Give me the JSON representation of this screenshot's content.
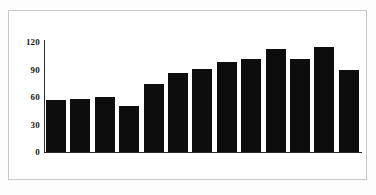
{
  "chart_data": {
    "type": "bar",
    "title": "",
    "subtitle": "",
    "xlabel": "",
    "ylabel": "",
    "categories": [
      "2006",
      "2007",
      "2008",
      "2009",
      "2010",
      "2011",
      "2012",
      "2013",
      "2014",
      "2015",
      "2016",
      "2017",
      "2018"
    ],
    "values": [
      57,
      58,
      60,
      50,
      74,
      86,
      91,
      98,
      102,
      112,
      102,
      115,
      90
    ],
    "data_labels": [
      "57",
      "58",
      "60",
      "50",
      "74",
      "86",
      "91",
      "98",
      "102",
      "112",
      "102",
      "115",
      "90"
    ],
    "ylim": [
      0,
      120
    ],
    "y_ticks": [
      0,
      30,
      60,
      90,
      120
    ],
    "y_tick_labels": [
      "0",
      "30",
      "60",
      "90",
      "120"
    ],
    "grid": false,
    "legend": null,
    "legend_position": "none",
    "bar_color": "#0d0d0d",
    "data_label_color": "#ffffff",
    "axis_color": "#2b2b2b",
    "tick_label_color": "#1a1a1a",
    "frame_color": "#c8c8c8",
    "background_color": "#ffffff"
  }
}
